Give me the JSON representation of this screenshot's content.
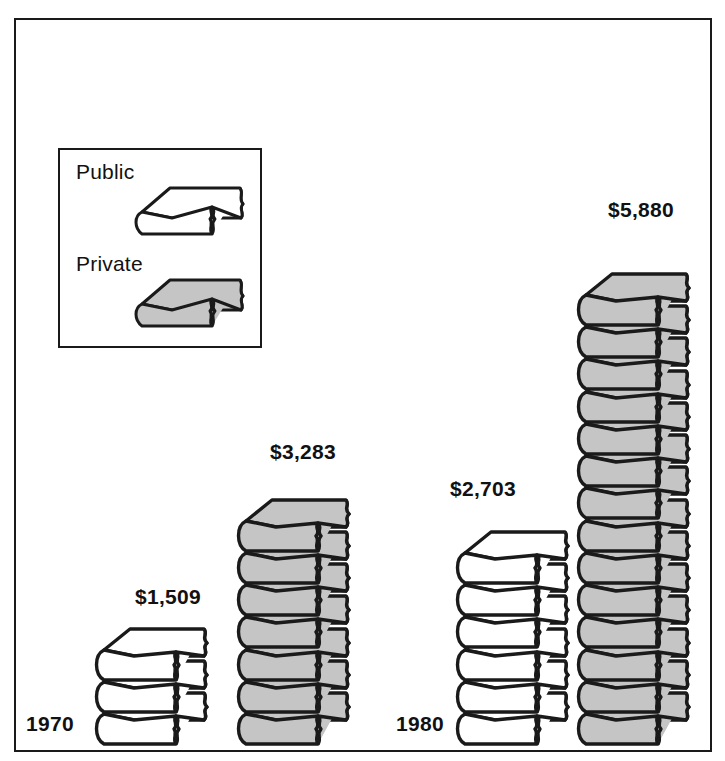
{
  "chart_data": {
    "type": "bar",
    "title": "",
    "subtitle": "",
    "xlabel": "",
    "ylabel": "",
    "units": "dollars",
    "pictogram": "book",
    "unit_value_per_book": 420,
    "categories": [
      "1970",
      "1980"
    ],
    "series": [
      {
        "name": "Public",
        "color": "#ffffff",
        "values": [
          1509,
          2703
        ],
        "labels": [
          "$1,509",
          "$2,703"
        ],
        "book_counts": [
          3,
          6
        ]
      },
      {
        "name": "Private",
        "color": "#c5c5c5",
        "values": [
          3283,
          5880
        ],
        "labels": [
          "$3,283",
          "$5,880"
        ],
        "book_counts": [
          7,
          14
        ]
      }
    ],
    "grid": false,
    "legend_position": "top-left"
  },
  "legend": {
    "public_label": "Public",
    "private_label": "Private"
  },
  "axis": {
    "year_1970": "1970",
    "year_1980": "1980"
  },
  "labels": {
    "public_1970": "$1,509",
    "private_1970": "$3,283",
    "public_1980": "$2,703",
    "private_1980": "$5,880"
  },
  "colors": {
    "outline": "#1a1a1a",
    "public_fill": "#ffffff",
    "private_fill": "#c5c5c5",
    "background": "#ffffff",
    "text": "#111111"
  }
}
